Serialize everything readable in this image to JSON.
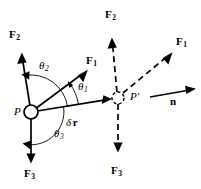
{
  "figure": {
    "type": "physics-vector-diagram",
    "background_color": "#ffffff",
    "stroke_color": "#000000",
    "points": {
      "P": {
        "label": "P",
        "x": 31,
        "y": 112,
        "radius": 7,
        "style": "solid-open-circle"
      },
      "P_prime": {
        "label": "P′",
        "x": 118,
        "y": 98,
        "radius": 6,
        "style": "dashed-open-circle"
      }
    },
    "labels": {
      "F1_left": {
        "base": "F",
        "sub": "1"
      },
      "F2_left": {
        "base": "F",
        "sub": "2"
      },
      "F3_left": {
        "base": "F",
        "sub": "3"
      },
      "F1_right": {
        "base": "F",
        "sub": "1"
      },
      "F2_right": {
        "base": "F",
        "sub": "2"
      },
      "F3_right": {
        "base": "F",
        "sub": "3"
      },
      "theta1": {
        "base": "θ",
        "sub": "1"
      },
      "theta2": {
        "base": "θ",
        "sub": "2"
      },
      "theta3": {
        "base": "θ",
        "sub": "3"
      },
      "delta_r": {
        "delta": "δ",
        "vector": "r"
      },
      "normal": {
        "base": "n"
      }
    },
    "vectors_solid": [
      {
        "name": "F2",
        "from": [
          31,
          112
        ],
        "to": [
          22,
          55
        ],
        "style": "solid"
      },
      {
        "name": "F1",
        "from": [
          31,
          112
        ],
        "to": [
          87,
          70
        ],
        "style": "solid"
      },
      {
        "name": "F3",
        "from": [
          31,
          112
        ],
        "to": [
          31,
          163
        ],
        "style": "solid"
      },
      {
        "name": "delta-r",
        "from": [
          31,
          112
        ],
        "to": [
          112,
          99
        ],
        "style": "solid"
      }
    ],
    "vectors_dashed": [
      {
        "name": "F2",
        "from": [
          118,
          98
        ],
        "to": [
          112,
          38
        ],
        "style": "dashed"
      },
      {
        "name": "F1",
        "from": [
          118,
          98
        ],
        "to": [
          172,
          52
        ],
        "style": "dashed"
      },
      {
        "name": "F3",
        "from": [
          118,
          98
        ],
        "to": [
          118,
          152
        ],
        "style": "dashed"
      }
    ],
    "normal_vector": {
      "name": "n",
      "from": [
        150,
        97
      ],
      "to": [
        196,
        89
      ],
      "style": "solid"
    },
    "angle_arcs": [
      {
        "name": "theta1",
        "center": [
          31,
          112
        ],
        "radius": 48,
        "from_deg": 9,
        "to_deg": 37,
        "arrowhead": "end"
      },
      {
        "name": "theta2",
        "center": [
          31,
          112
        ],
        "radius": 37,
        "from_deg": 9,
        "to_deg": 99,
        "arrowhead": "end"
      },
      {
        "name": "theta3",
        "center": [
          31,
          112
        ],
        "radius": 33,
        "from_deg": 9,
        "to_deg": -85,
        "arrowhead": "end"
      }
    ]
  }
}
